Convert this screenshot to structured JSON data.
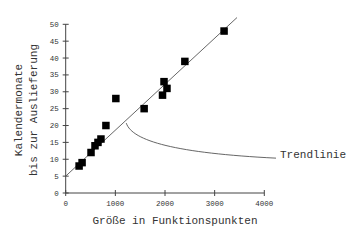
{
  "chart_data": {
    "type": "scatter",
    "title": "",
    "xlabel": "Größe in Funktionspunkten",
    "ylabel": [
      "Kalendermonate",
      "bis zur Auslieferung"
    ],
    "xlim": [
      0,
      4000
    ],
    "ylim": [
      0,
      50
    ],
    "xticks": [
      0,
      1000,
      2000,
      3000,
      4000
    ],
    "yticks": [
      0,
      5,
      10,
      15,
      20,
      25,
      30,
      35,
      40,
      45,
      50
    ],
    "grid": false,
    "legend": null,
    "series": [
      {
        "name": "Projekte",
        "marker": "square",
        "color": "#000000",
        "points": [
          {
            "x": 270,
            "y": 8
          },
          {
            "x": 330,
            "y": 9
          },
          {
            "x": 510,
            "y": 12
          },
          {
            "x": 590,
            "y": 14
          },
          {
            "x": 650,
            "y": 15
          },
          {
            "x": 710,
            "y": 16
          },
          {
            "x": 810,
            "y": 20
          },
          {
            "x": 1010,
            "y": 28
          },
          {
            "x": 1580,
            "y": 25
          },
          {
            "x": 1950,
            "y": 29
          },
          {
            "x": 1980,
            "y": 33
          },
          {
            "x": 2040,
            "y": 31
          },
          {
            "x": 2400,
            "y": 39
          },
          {
            "x": 3190,
            "y": 48
          }
        ]
      }
    ],
    "trendline": {
      "x0": 0,
      "y0": 5,
      "x1": 3450,
      "y1": 52,
      "color": "#555555"
    },
    "annotations": [
      {
        "text": "Trendlinie",
        "points_to": {
          "x": 1200,
          "y": 21
        }
      }
    ]
  }
}
